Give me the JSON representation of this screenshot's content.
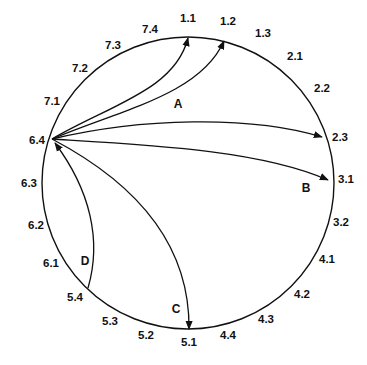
{
  "diagram": {
    "type": "circular-graph",
    "stroke_color": "#111111",
    "background": "#ffffff",
    "nodes": [
      {
        "id": "1.1",
        "x": 188,
        "y": 22
      },
      {
        "id": "1.2",
        "x": 228,
        "y": 25
      },
      {
        "id": "1.3",
        "x": 263,
        "y": 37
      },
      {
        "id": "2.1",
        "x": 295,
        "y": 60
      },
      {
        "id": "2.2",
        "x": 322,
        "y": 92
      },
      {
        "id": "2.3",
        "x": 336,
        "y": 141
      },
      {
        "id": "3.1",
        "x": 343,
        "y": 183
      },
      {
        "id": "3.2",
        "x": 340,
        "y": 226
      },
      {
        "id": "4.1",
        "x": 327,
        "y": 263
      },
      {
        "id": "4.2",
        "x": 302,
        "y": 298
      },
      {
        "id": "4.3",
        "x": 266,
        "y": 323
      },
      {
        "id": "4.4",
        "x": 228,
        "y": 339
      },
      {
        "id": "5.1",
        "x": 189,
        "y": 345
      },
      {
        "id": "5.2",
        "x": 146,
        "y": 339
      },
      {
        "id": "5.3",
        "x": 110,
        "y": 325
      },
      {
        "id": "5.4",
        "x": 76,
        "y": 298
      },
      {
        "id": "6.1",
        "x": 51,
        "y": 263
      },
      {
        "id": "6.2",
        "x": 36,
        "y": 226
      },
      {
        "id": "6.3",
        "x": 30,
        "y": 184
      },
      {
        "id": "6.4",
        "x": 36,
        "y": 143
      },
      {
        "id": "7.1",
        "x": 52,
        "y": 105
      },
      {
        "id": "7.2",
        "x": 80,
        "y": 71
      },
      {
        "id": "7.3",
        "x": 113,
        "y": 47
      },
      {
        "id": "7.4",
        "x": 150,
        "y": 30
      }
    ],
    "edge_labels": [
      {
        "id": "A",
        "x": 178,
        "y": 106
      },
      {
        "id": "B",
        "x": 305,
        "y": 190
      },
      {
        "id": "C",
        "x": 175,
        "y": 310
      },
      {
        "id": "D",
        "x": 84,
        "y": 264
      }
    ],
    "edges": [
      {
        "from": "6.4",
        "to": "1.1",
        "group": "A"
      },
      {
        "from": "6.4",
        "to": "1.2",
        "group": "A"
      },
      {
        "from": "6.4",
        "to": "2.3",
        "group": "B"
      },
      {
        "from": "6.4",
        "to": "3.1",
        "group": "B"
      },
      {
        "from": "6.4",
        "to": "5.1",
        "group": "C"
      },
      {
        "from": "5.4",
        "to": "6.4",
        "group": "D"
      }
    ]
  }
}
